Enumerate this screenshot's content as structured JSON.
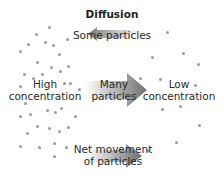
{
  "diagram": {
    "title": "Diffusion",
    "labels": {
      "high_line1": "High",
      "high_line2": "concentration",
      "low_line1": "Low",
      "low_line2": "concentration",
      "some": "Some particles",
      "many_line1": "Many",
      "many_line2": "particles",
      "net_line1": "Net movement",
      "net_line2": "of particles"
    },
    "arrows": [
      {
        "name": "some-particles-arrow",
        "direction": "left",
        "size": "small"
      },
      {
        "name": "many-particles-arrow",
        "direction": "right",
        "size": "large"
      },
      {
        "name": "net-movement-arrow",
        "direction": "right",
        "size": "medium"
      }
    ],
    "colors": {
      "dot": "#9a9a9a",
      "arrow_light": "#eeeeee",
      "arrow_dark": "#7a7a7a",
      "text": "#2a2a2a"
    }
  }
}
